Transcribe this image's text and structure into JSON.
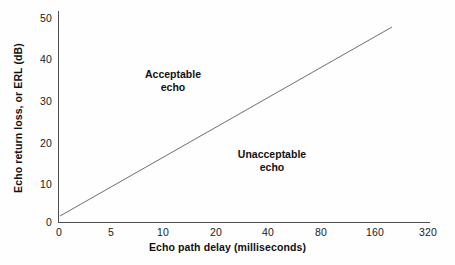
{
  "chart_data": {
    "type": "line",
    "title": "",
    "xlabel": "Echo path delay (milliseconds)",
    "ylabel": "Echo return loss, or ERL (dB)",
    "x_tick_labels": [
      "0",
      "5",
      "10",
      "20",
      "40",
      "80",
      "160",
      "320"
    ],
    "y_tick_labels": [
      "0",
      "10",
      "20",
      "30",
      "40",
      "50"
    ],
    "x_tick_values": [
      0,
      5,
      10,
      20,
      40,
      80,
      160,
      320
    ],
    "y_tick_values": [
      0,
      10,
      20,
      30,
      40,
      50
    ],
    "xlim": [
      0,
      320
    ],
    "ylim": [
      0,
      52
    ],
    "x_scale": "log-like (0 then doubling: 5, 10, 20, 40, 80, 160, 320)",
    "grid": false,
    "legend": null,
    "series": [
      {
        "name": "Echo tolerance threshold",
        "color": "#6e6e6e",
        "points": [
          {
            "x": 5,
            "y": 1.5
          },
          {
            "x": 200,
            "y": 48.5
          }
        ],
        "endpoint_labels": [
          "(5 ms, ~1.5 dB)",
          "(~200 ms, ~48.5 dB)"
        ]
      }
    ],
    "annotations": [
      {
        "text": "Acceptable\necho",
        "region": "above-line",
        "x_approx": 12,
        "y_approx": 36
      },
      {
        "text": "Unacceptable\necho",
        "region": "below-line",
        "x_approx": 45,
        "y_approx": 17
      }
    ]
  },
  "axis": {
    "y_ticks": [
      {
        "label": "50",
        "top": 13
      },
      {
        "label": "40",
        "top": 54
      },
      {
        "label": "30",
        "top": 96
      },
      {
        "label": "20",
        "top": 138
      },
      {
        "label": "10",
        "top": 179
      },
      {
        "label": "0",
        "top": 217
      }
    ],
    "x_ticks": [
      {
        "label": "0",
        "left": 59
      },
      {
        "label": "5",
        "left": 111
      },
      {
        "label": "10",
        "left": 163
      },
      {
        "label": "20",
        "left": 216
      },
      {
        "label": "40",
        "left": 268
      },
      {
        "label": "80",
        "left": 321
      },
      {
        "label": "160",
        "left": 375
      },
      {
        "label": "320",
        "left": 428
      }
    ]
  },
  "annotations": {
    "acceptable": "Acceptable\necho",
    "unacceptable": "Unacceptable\necho"
  },
  "colors": {
    "background": "#fefefe",
    "axis": "#4d4d4d",
    "series_line": "#6e6e6e",
    "text": "#111111"
  }
}
